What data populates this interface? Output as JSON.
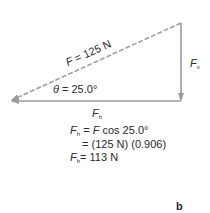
{
  "diagram": {
    "type": "vector-triangle",
    "colors": {
      "line": "#9a9a9a",
      "text": "#2a2a2a"
    },
    "resultant": {
      "symbol": "F",
      "eq": " = 125 N",
      "style": "dashed"
    },
    "angle": {
      "symbol": "θ",
      "eq": " = 25.0°"
    },
    "vertical_component": {
      "symbol": "F",
      "sub": "v"
    },
    "horizontal_component": {
      "symbol": "F",
      "sub": "h"
    }
  },
  "equations": [
    {
      "lhs_symbol": "F",
      "lhs_sub": "h",
      "rhs_pre": "= ",
      "rhs_symbol": "F",
      "rhs": " cos 25.0°"
    },
    {
      "rhs": "= (125 N) (0.906)"
    },
    {
      "lhs_symbol": "F",
      "lhs_sub": "h",
      "rhs": "= 113 N"
    }
  ],
  "panel_label": "b"
}
